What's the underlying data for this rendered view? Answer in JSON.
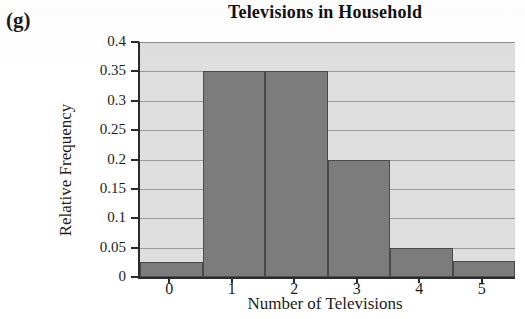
{
  "panel": {
    "label": "(g)"
  },
  "chart_data": {
    "type": "bar",
    "title": "Televisions in Household",
    "xlabel": "Number of Televisions",
    "ylabel": "Relative Frequency",
    "categories": [
      "0",
      "1",
      "2",
      "3",
      "4",
      "5"
    ],
    "values": [
      0.025,
      0.35,
      0.35,
      0.2,
      0.05,
      0.027
    ],
    "ylim": [
      0,
      0.4
    ],
    "xlim": [
      -0.5,
      5.5
    ],
    "ytick_labels": [
      "0",
      "0.05",
      "0.1",
      "0.15",
      "0.2",
      "0.25",
      "0.3",
      "0.35",
      "0.4"
    ],
    "ytick_values": [
      0,
      0.05,
      0.1,
      0.15,
      0.2,
      0.25,
      0.3,
      0.35,
      0.4
    ],
    "xtick_labels": [
      "0",
      "1",
      "2",
      "3",
      "4",
      "5"
    ],
    "grid": true,
    "legend": false,
    "colors": {
      "bar_fill": "#7c7c7c",
      "bar_edge": "#4a4a4a",
      "plot_background": "#dedede",
      "gridline": "#9a9a9a",
      "axis": "#2b2b2b",
      "text": "#1c1c1c",
      "page_background": "#ffffff"
    }
  }
}
